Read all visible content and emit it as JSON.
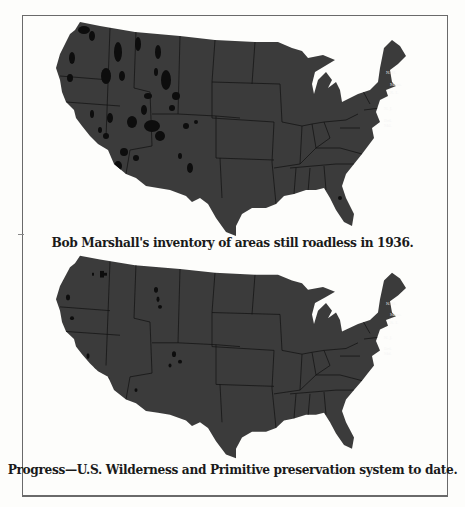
{
  "figure": {
    "frame_border_color": "#6a6a6a",
    "land_color": "#3b3b3b",
    "wild_area_color": "#0d0d0d",
    "state_line_color": "#151515"
  },
  "maps": [
    {
      "id": "roadless-1936",
      "caption": "Bob Marshall's inventory of areas still roadless in 1936.",
      "state_labels": [
        "N. H.",
        "Mass.",
        "R. I.",
        "N. J.",
        "Del.",
        "Md."
      ]
    },
    {
      "id": "wilderness-system-to-date",
      "caption": "Progress—U.S. Wilderness and Primitive preservation system to date.",
      "state_labels": [
        "N. H.",
        "Mass.",
        "R. I.",
        "N. J.",
        "Del.",
        "Md."
      ]
    }
  ]
}
